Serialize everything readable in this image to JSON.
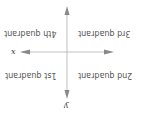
{
  "diagram": {
    "orientation": "rotated-180",
    "axes": {
      "x_label": "x",
      "y_label": "y",
      "color": "#a0a0a0",
      "arrow_color": "#7a7a7a"
    },
    "quadrants": [
      {
        "label": "1st quadrant"
      },
      {
        "label": "2nd quadrant"
      },
      {
        "label": "3rd quadrant"
      },
      {
        "label": "4th quadrant"
      }
    ],
    "text_color": "#555555"
  }
}
